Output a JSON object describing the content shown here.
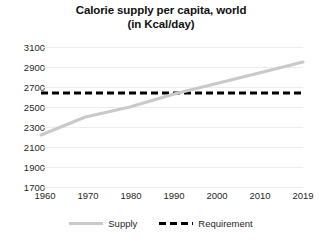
{
  "chart_data": {
    "type": "line",
    "title": "Calorie supply per capita, world (in Kcal/day)",
    "title_lines": [
      "Calorie supply per capita, world",
      "(in Kcal/day)"
    ],
    "xlabel": "",
    "ylabel": "",
    "x": [
      1960,
      1970,
      1980,
      1990,
      2000,
      2010,
      2019
    ],
    "categories": [
      "1960",
      "1970",
      "1980",
      "1990",
      "2000",
      "2010",
      "2019"
    ],
    "xlim": [
      1960,
      2019
    ],
    "ylim": [
      1700,
      3100
    ],
    "y_ticks": [
      1700,
      1900,
      2100,
      2300,
      2500,
      2700,
      2900,
      3100
    ],
    "y_tick_labels": [
      "1700",
      "1900",
      "2100",
      "2300",
      "2500",
      "2700",
      "2900",
      "3100"
    ],
    "x_tick_labels": [
      "1960",
      "1970",
      "1980",
      "1990",
      "2000",
      "2010",
      "2019"
    ],
    "grid": true,
    "grid_axis": "y",
    "legend_position": "bottom",
    "series": [
      {
        "name": "Supply",
        "style": "solid",
        "color": "#c9c9c9",
        "values": [
          2220,
          2400,
          2500,
          2630,
          2740,
          2850,
          2950
        ]
      },
      {
        "name": "Requirement",
        "style": "dashed",
        "color": "#000000",
        "values": [
          2640,
          2640,
          2640,
          2640,
          2640,
          2640,
          2640
        ]
      }
    ],
    "annotations": []
  },
  "legend": {
    "items": [
      {
        "label": "Supply",
        "color": "#c9c9c9",
        "style": "solid"
      },
      {
        "label": "Requirement",
        "color": "#000000",
        "style": "dashed"
      }
    ]
  }
}
